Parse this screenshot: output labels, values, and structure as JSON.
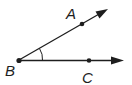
{
  "diagram": {
    "type": "angle",
    "colors": {
      "stroke": "#1e1e1e",
      "background": "#ffffff"
    },
    "vertex": {
      "label": "B",
      "x": 19,
      "y": 60,
      "label_x": 5,
      "label_y": 76
    },
    "points": [
      {
        "label": "A",
        "x": 82,
        "y": 24,
        "label_x": 66,
        "label_y": 19
      },
      {
        "label": "C",
        "x": 89,
        "y": 61,
        "label_x": 82,
        "label_y": 83
      }
    ],
    "rays": [
      {
        "name": "BA",
        "from": "B",
        "through": "A",
        "tip_x": 108,
        "tip_y": 9
      },
      {
        "name": "BC",
        "from": "B",
        "through": "C",
        "tip_x": 124,
        "tip_y": 61
      }
    ],
    "angle_mark": {
      "vertex": "B",
      "arcs": 1
    }
  }
}
